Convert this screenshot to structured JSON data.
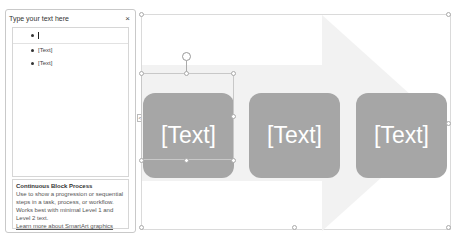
{
  "text_pane": {
    "title": "Type your text here",
    "close_label": "×",
    "items": [
      {
        "text": ""
      },
      {
        "text": "[Text]"
      },
      {
        "text": "[Text]"
      }
    ],
    "description": {
      "title": "Continuous Block Process",
      "body": "Use to show a progression or sequential steps in a task, process, or workflow. Works best with minimal Level 1 and Level 2 text.",
      "link": "Learn more about SmartArt graphics"
    }
  },
  "smartart": {
    "layout": "Continuous Block Process",
    "arrow_color": "#f2f2f2",
    "block_color": "#a6a6a6",
    "blocks": [
      {
        "text": "[Text]"
      },
      {
        "text": "[Text]"
      },
      {
        "text": "[Text]"
      }
    ],
    "toggle_label": "<"
  }
}
